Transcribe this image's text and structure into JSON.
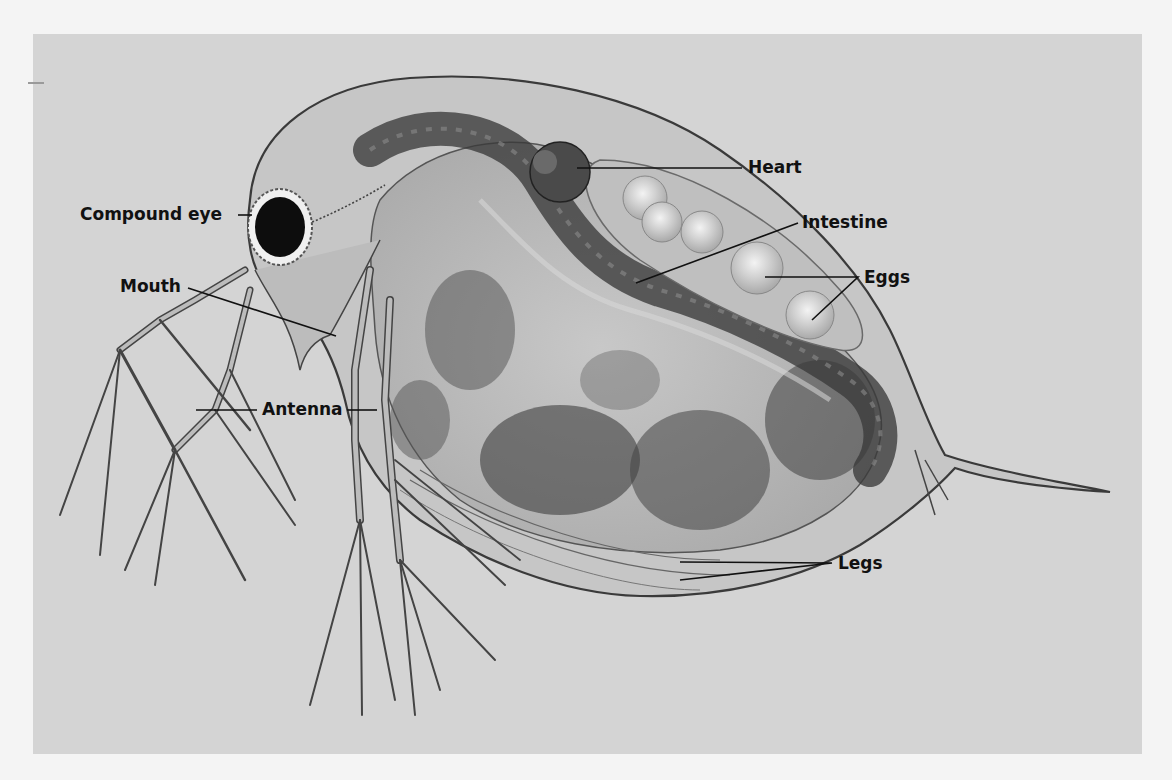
{
  "figure": {
    "colors": {
      "page_bg": "#f4f4f4",
      "panel_bg": "#d4d4d4",
      "body_fill": "#bdbdbd",
      "shell_fill": "#c9c9c9",
      "dark_tissue": "#4a4a4a",
      "egg_fill": "#d8d8d8",
      "eye": "#0d0d0d",
      "leader_line": "#111111",
      "label_text": "#111111"
    },
    "labels": [
      {
        "id": "compound-eye",
        "text": "Compound eye"
      },
      {
        "id": "mouth",
        "text": "Mouth"
      },
      {
        "id": "antenna",
        "text": "Antenna"
      },
      {
        "id": "heart",
        "text": "Heart"
      },
      {
        "id": "intestine",
        "text": "Intestine"
      },
      {
        "id": "eggs",
        "text": "Eggs"
      },
      {
        "id": "legs",
        "text": "Legs"
      }
    ]
  }
}
